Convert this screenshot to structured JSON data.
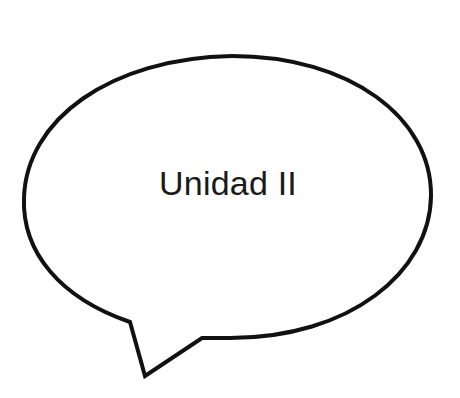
{
  "speech_bubble": {
    "text": "Unidad II",
    "stroke_color": "#111111",
    "fill_color": "#ffffff"
  }
}
